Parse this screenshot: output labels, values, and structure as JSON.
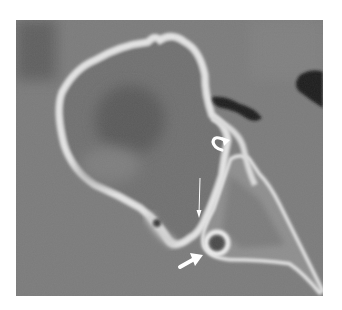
{
  "image": {
    "type": "CT scan (grayscale)",
    "description": "Axial CT section showing a large rounded bony structure with thin cortical rim, adjacent triangular bony structure with small round foramen, and annotation arrows",
    "colors": {
      "page_background": "#ffffff",
      "soft_tissue": "#7a7a7a",
      "bone_rim": "#e6e6e6",
      "marrow": "#6a6a6a",
      "air": "#141414",
      "arrow": "#ffffff"
    },
    "annotations": [
      {
        "name": "curved-arrow",
        "position": [
          220,
          145
        ]
      },
      {
        "name": "thin-arrow",
        "position": [
          200,
          215
        ]
      },
      {
        "name": "short-arrow",
        "position": [
          188,
          262
        ]
      }
    ]
  }
}
